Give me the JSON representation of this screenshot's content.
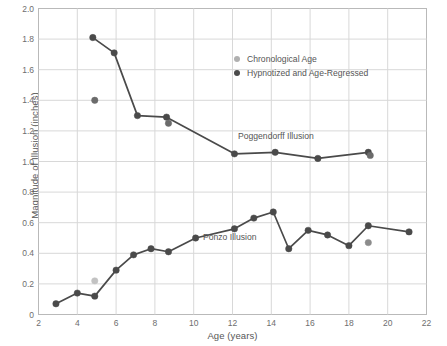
{
  "chart_data": {
    "type": "line",
    "title": "",
    "xlabel": "Age (years)",
    "ylabel": "Magnitude of Illusion (inches)",
    "xlim": [
      2,
      22
    ],
    "ylim": [
      0,
      2.0
    ],
    "xticks": [
      2,
      4,
      6,
      8,
      10,
      12,
      14,
      16,
      18,
      20,
      22
    ],
    "yticks": [
      "0",
      "0.2",
      "0.4",
      "0.6",
      "0.8",
      "1.0",
      "1.2",
      "1.4",
      "1.6",
      "1.8",
      "2.0"
    ],
    "grid": true,
    "legend_position": "upper-right-inside",
    "legend": [
      {
        "label": "Chronological Age",
        "color": "#b0b0b0"
      },
      {
        "label": "Hypnotized and Age-Regressed",
        "color": "#4a4a4a"
      }
    ],
    "annotations": [
      {
        "text": "Poggendorff Illusion",
        "x": 12.9,
        "y": 1.14
      },
      {
        "text": "Ponzo Illusion",
        "x": 10.6,
        "y": 0.55
      }
    ],
    "series": [
      {
        "name": "Poggendorff Illusion",
        "marker_color": "#4a4a4a",
        "line_color": "#4a4a4a",
        "points": [
          {
            "x": 4.8,
            "y": 1.81
          },
          {
            "x": 5.9,
            "y": 1.71
          },
          {
            "x": 7.1,
            "y": 1.3
          },
          {
            "x": 8.6,
            "y": 1.29
          },
          {
            "x": 12.1,
            "y": 1.05
          },
          {
            "x": 14.2,
            "y": 1.06
          },
          {
            "x": 16.4,
            "y": 1.02
          },
          {
            "x": 19.0,
            "y": 1.06
          }
        ]
      },
      {
        "name": "Poggendorff Illusion (chronological markers)",
        "marker_color": "#6b6b6b",
        "line_color": "none",
        "points": [
          {
            "x": 4.9,
            "y": 1.4
          },
          {
            "x": 8.7,
            "y": 1.25
          },
          {
            "x": 19.1,
            "y": 1.04
          }
        ]
      },
      {
        "name": "Ponzo Illusion",
        "marker_color": "#4a4a4a",
        "line_color": "#4a4a4a",
        "points": [
          {
            "x": 2.9,
            "y": 0.07
          },
          {
            "x": 4.0,
            "y": 0.14
          },
          {
            "x": 4.9,
            "y": 0.12
          },
          {
            "x": 6.0,
            "y": 0.29
          },
          {
            "x": 6.9,
            "y": 0.39
          },
          {
            "x": 7.8,
            "y": 0.43
          },
          {
            "x": 8.7,
            "y": 0.41
          },
          {
            "x": 10.1,
            "y": 0.5
          },
          {
            "x": 12.1,
            "y": 0.56
          },
          {
            "x": 13.1,
            "y": 0.63
          },
          {
            "x": 14.1,
            "y": 0.67
          },
          {
            "x": 14.9,
            "y": 0.43
          },
          {
            "x": 15.9,
            "y": 0.55
          },
          {
            "x": 16.9,
            "y": 0.52
          },
          {
            "x": 18.0,
            "y": 0.45
          },
          {
            "x": 19.0,
            "y": 0.58
          },
          {
            "x": 21.1,
            "y": 0.54
          }
        ]
      },
      {
        "name": "Ponzo Illusion (chronological markers)",
        "marker_color": "#c2c2c2",
        "line_color": "none",
        "points": [
          {
            "x": 4.9,
            "y": 0.22
          }
        ]
      },
      {
        "name": "Ponzo Illusion (extra marker)",
        "marker_color": "#8c8c8c",
        "line_color": "none",
        "points": [
          {
            "x": 19.0,
            "y": 0.47
          }
        ]
      }
    ]
  },
  "axes": {
    "xlabel": "Age (years)",
    "ylabel": "Magnitude of Illusion (inches)"
  },
  "colors": {
    "grid": "#d8d8d8",
    "frame": "#b9b9b9",
    "dark_marker": "#4a4a4a",
    "light_marker": "#c2c2c2",
    "text": "#5a5a5a",
    "background": "#ffffff"
  }
}
